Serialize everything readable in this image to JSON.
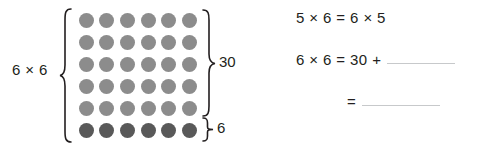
{
  "diagram": {
    "left_label": "6 × 6",
    "rows": 6,
    "columns": 6,
    "dot_colors": {
      "light": "#8c8c8c",
      "dark": "#595959"
    },
    "row_groups": [
      {
        "name": "top-five-rows",
        "rows": 5,
        "shade": "light",
        "brace_label": "30"
      },
      {
        "name": "bottom-row",
        "rows": 1,
        "shade": "dark",
        "brace_label": "6"
      }
    ],
    "brace_30_label": "30",
    "brace_6_label": "6"
  },
  "equations": {
    "line1": "5 × 6 = 6 × 5",
    "line2_prefix": "6 × 6 = 30 +",
    "line2_blank": "",
    "line3_prefix": "=",
    "line3_blank": ""
  },
  "colors": {
    "text": "#231f20",
    "blank_rule": "#c7c9cb",
    "background": "#ffffff"
  }
}
